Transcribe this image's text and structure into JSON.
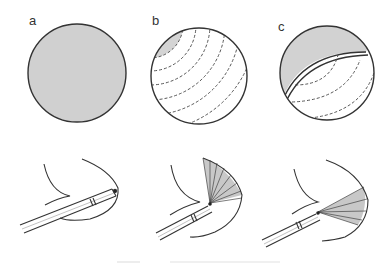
{
  "figure": {
    "panels": [
      {
        "id": "a",
        "label": "a",
        "view": "full field shaded",
        "circle": {
          "cx": 77,
          "cy": 73,
          "r": 49
        }
      },
      {
        "id": "b",
        "label": "b",
        "view": "shaded cap upper-left with dashed concentric arcs",
        "circle": {
          "cx": 199,
          "cy": 76,
          "r": 48
        }
      },
      {
        "id": "c",
        "label": "c",
        "view": "shaded crescent upper-left separated by double line, dashed arcs below",
        "circle": {
          "cx": 327,
          "cy": 73,
          "r": 47
        }
      }
    ],
    "bottom_row": [
      {
        "id": "a",
        "description": "endoscope tip at wall, no fan"
      },
      {
        "id": "b",
        "description": "endoscope with wide shaded fan of rays"
      },
      {
        "id": "c",
        "description": "endoscope with narrower shaded fan of rays"
      }
    ],
    "caption": "",
    "colors": {
      "fill": "#cfcfcf",
      "stroke": "#333333",
      "background": "#ffffff"
    }
  }
}
